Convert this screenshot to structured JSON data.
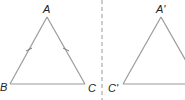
{
  "diagram": {
    "type": "geometry-reflection",
    "colors": {
      "line": "#9a9a9a",
      "dashed_axis": "#9a9a9a",
      "label": "#222222",
      "background": "#ffffff"
    },
    "left_triangle": {
      "vertices": {
        "A": {
          "label": "A",
          "x": 47,
          "y": 17
        },
        "B": {
          "label": "B",
          "x": 10,
          "y": 84
        },
        "C": {
          "label": "C",
          "x": 85,
          "y": 84
        }
      },
      "equal_sides": [
        "AB",
        "AC"
      ],
      "tick_marks": 2
    },
    "mirror_line": {
      "style": "dashed",
      "x": 102
    },
    "right_triangle": {
      "vertices": {
        "A_prime": {
          "label": "A'",
          "x": 161,
          "y": 17
        },
        "C_prime": {
          "label": "C'",
          "x": 123,
          "y": 84
        }
      },
      "cropped_at_right_edge": true
    }
  }
}
